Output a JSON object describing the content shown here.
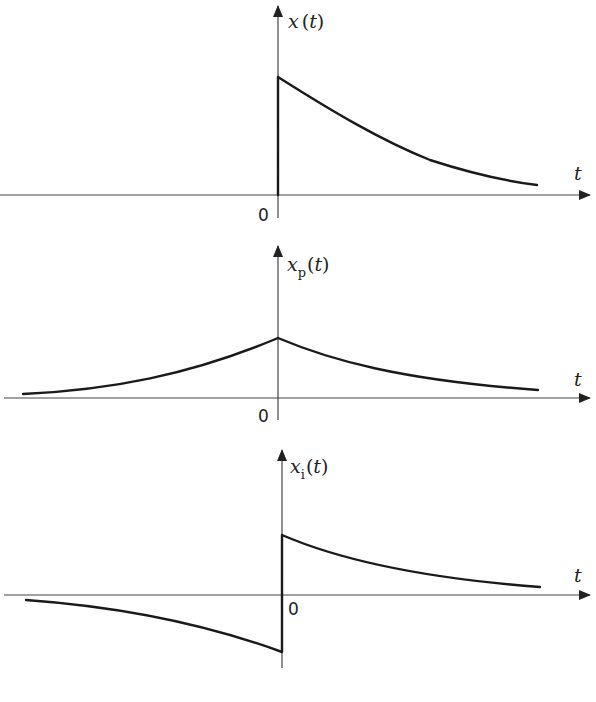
{
  "diagram": {
    "panels": [
      {
        "id": "x",
        "func_var": "x",
        "func_sub": "",
        "func_open": "(",
        "func_arg": "t",
        "func_close": ")",
        "axis_label": "t",
        "origin_label": "0",
        "description": "Causal decaying exponential: zero for t<0, jumps at t=0 and decays for t>0"
      },
      {
        "id": "xp",
        "func_var": "x",
        "func_sub": "p",
        "func_open": "(",
        "func_arg": "t",
        "func_close": ")",
        "axis_label": "t",
        "origin_label": "0",
        "description": "Even part: symmetric two-sided decaying exponential peaking at t=0"
      },
      {
        "id": "xi",
        "func_var": "x",
        "func_sub": "i",
        "func_open": "(",
        "func_arg": "t",
        "func_close": ")",
        "axis_label": "t",
        "origin_label": "0",
        "description": "Odd part: positive decaying for t>0, negative mirrored for t<0"
      }
    ],
    "colors": {
      "curve": "#1a1a1a",
      "axis": "#444444",
      "background": "#ffffff"
    }
  }
}
